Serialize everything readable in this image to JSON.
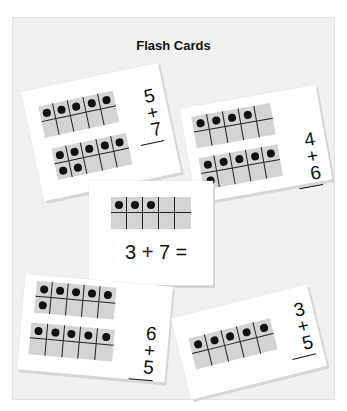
{
  "title": "Flash Cards",
  "cards": [
    {
      "id": "card-1",
      "top_addend": "5",
      "bottom_addend": "+ 7",
      "frames": [
        {
          "filled": 5,
          "pattern": "top-row"
        },
        {
          "filled": 7,
          "pattern": "top-row-plus-2"
        }
      ]
    },
    {
      "id": "card-2",
      "top_addend": "4",
      "bottom_addend": "+ 6",
      "frames": [
        {
          "filled": 4,
          "pattern": "top-row"
        },
        {
          "filled": 6,
          "pattern": "top-row-plus-1"
        }
      ]
    },
    {
      "id": "card-3",
      "equation": "3 + 7 =",
      "frames": [
        {
          "filled": 3,
          "pattern": "top-row"
        }
      ]
    },
    {
      "id": "card-4",
      "top_addend": "6",
      "bottom_addend": "+ 5",
      "frames": [
        {
          "filled": 6,
          "pattern": "top-row-plus-1"
        },
        {
          "filled": 5,
          "pattern": "top-row"
        }
      ]
    },
    {
      "id": "card-5",
      "top_addend": "3",
      "bottom_addend": "+ 5",
      "frames": [
        {
          "filled": 5,
          "pattern": "top-row"
        }
      ]
    }
  ],
  "colors": {
    "background": "#f1f1f1",
    "card": "#ffffff",
    "frame_fill": "#d4d4d4",
    "dot": "#111111"
  }
}
